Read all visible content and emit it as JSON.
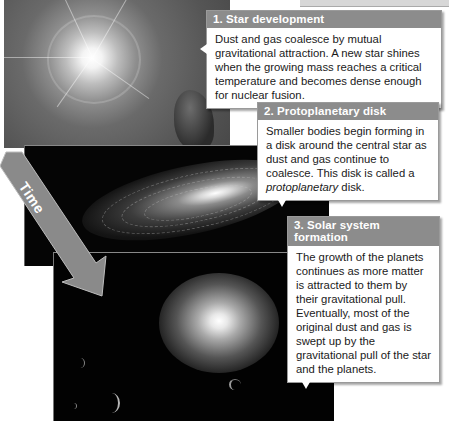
{
  "figure": {
    "arrow_label": "Time",
    "panels": [
      {
        "id": "star-development",
        "image": "bright young star with rays and surrounding dust cloud"
      },
      {
        "id": "protoplanetary-disk",
        "image": "central star surrounded by spiral disk of dust and gas"
      },
      {
        "id": "solar-system-formation",
        "image": "central star with crescent-lit planets"
      }
    ],
    "callouts": [
      {
        "title": "1. Star development",
        "text": "Dust and gas coalesce by mutual gravitational attraction. A new star shines when the growing mass reaches a critical temperature and becomes dense enough for nuclear fusion."
      },
      {
        "title": "2. Protoplanetary disk",
        "text_before": "Smaller bodies begin forming in a disk around the central star as dust and gas continue to coalesce. This disk is called a ",
        "text_italic": "protoplanetary",
        "text_after": " disk."
      },
      {
        "title": "3. Solar system formation",
        "text": "The growth of the planets continues as more matter is attracted to them by their gravitational pull. Eventually, most of the original dust and gas is swept up by the gravitational pull of the star and the planets."
      }
    ],
    "colors": {
      "callout_header": "#8c8c8c",
      "arrow": "#8a8a8a",
      "background": "#ffffff"
    }
  }
}
